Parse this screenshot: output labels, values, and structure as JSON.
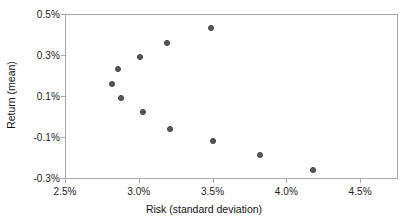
{
  "chart_data": {
    "type": "scatter",
    "title": "",
    "xlabel": "Risk (standard deviation)",
    "ylabel": "Return (mean)",
    "xlim": [
      2.5,
      4.75
    ],
    "ylim": [
      -0.3,
      0.5
    ],
    "xtick_labels": [
      "2.5%",
      "3.0%",
      "3.5%",
      "4.0%",
      "4.5%"
    ],
    "xticks": [
      2.5,
      3.0,
      3.5,
      4.0,
      4.5
    ],
    "ytick_labels": [
      "0.5%",
      "0.3%",
      "0.1%",
      "-0.1%",
      "-0.3%"
    ],
    "yticks": [
      0.5,
      0.3,
      0.1,
      -0.1,
      -0.3
    ],
    "grid": false,
    "legend": false,
    "marker_color": "#5a5a5a",
    "marker_edge_color": "#3d3d3d",
    "frame_color": "#a8a8a8",
    "series": [
      {
        "name": "portfolios",
        "points": [
          {
            "x": 2.82,
            "y": 0.16
          },
          {
            "x": 2.86,
            "y": 0.23
          },
          {
            "x": 2.88,
            "y": 0.09
          },
          {
            "x": 3.01,
            "y": 0.29
          },
          {
            "x": 3.03,
            "y": 0.02
          },
          {
            "x": 3.19,
            "y": 0.36
          },
          {
            "x": 3.21,
            "y": -0.06
          },
          {
            "x": 3.49,
            "y": 0.43
          },
          {
            "x": 3.5,
            "y": -0.12
          },
          {
            "x": 3.82,
            "y": -0.19
          },
          {
            "x": 4.18,
            "y": -0.26
          }
        ]
      }
    ]
  },
  "geometry": {
    "plot_left": 65,
    "plot_top": 14,
    "plot_right": 397,
    "plot_bottom": 178,
    "x_axis_title_top": 203,
    "y_axis_title_center_x": 11,
    "y_axis_title_center_y": 96
  }
}
